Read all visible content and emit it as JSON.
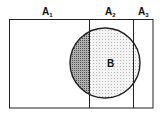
{
  "diagram": {
    "type": "venn-partition",
    "partitions": [
      {
        "id": "A1",
        "label": "A",
        "subscript": "1"
      },
      {
        "id": "A2",
        "label": "A",
        "subscript": "2"
      },
      {
        "id": "A3",
        "label": "A",
        "subscript": "3"
      }
    ],
    "event": {
      "id": "B",
      "label": "B"
    },
    "colors": {
      "stroke": "#222222",
      "dark_shade": "#8a8a8a",
      "light_shade": "#e6e6e6",
      "background": "#ffffff"
    }
  }
}
